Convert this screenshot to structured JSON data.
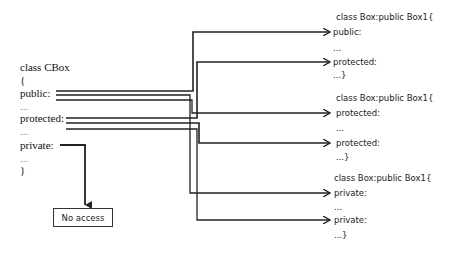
{
  "base_class": {
    "lines": [
      "class CBox",
      "{",
      "public:",
      "...",
      "protected:",
      "...",
      "private:",
      "...",
      "}"
    ]
  },
  "derived_blocks": [
    {
      "header": "class Box:public Box1{",
      "lines": [
        "public:",
        "...",
        "protected:",
        "...}"
      ]
    },
    {
      "header": "class Box:public Box1{",
      "lines": [
        "protected:",
        "...",
        "protected:",
        "...}"
      ]
    },
    {
      "header": "class Box:public Box1{",
      "lines": [
        "private:",
        "...",
        "private:",
        "...}"
      ]
    }
  ],
  "no_access_box": {
    "label": "No access"
  },
  "colors": {
    "line": "#222222",
    "background": "#ffffff"
  }
}
